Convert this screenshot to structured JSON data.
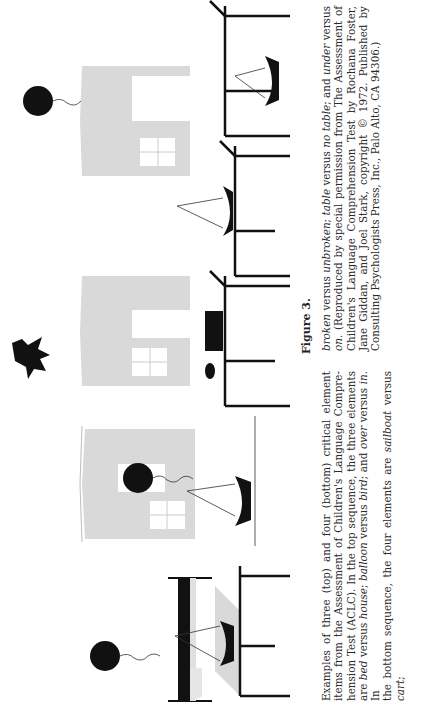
{
  "figure": {
    "label": "Figure 3.",
    "top_row_title": "Top sequence (three critical elements)",
    "bottom_row_title": "Bottom sequence (four critical elements)",
    "top_row_panels": [
      {
        "id": "balloon-and-bed",
        "elements": [
          "balloon",
          "bed"
        ]
      },
      {
        "id": "balloon-in-house",
        "elements": [
          "balloon",
          "house"
        ]
      },
      {
        "id": "bird-over-house",
        "elements": [
          "bird",
          "house"
        ]
      },
      {
        "id": "balloon-over-house",
        "elements": [
          "balloon",
          "house"
        ]
      }
    ],
    "bottom_row_panels": [
      {
        "id": "sailboat-on-table",
        "elements": [
          "sailboat",
          "table"
        ]
      },
      {
        "id": "sailboat-no-table",
        "elements": [
          "sailboat"
        ]
      },
      {
        "id": "broken-cart-under-table",
        "elements": [
          "cart",
          "table"
        ]
      },
      {
        "id": "sailboat-over-table",
        "elements": [
          "sailboat",
          "table"
        ]
      },
      {
        "id": "sailboat-under-table",
        "elements": [
          "sailboat",
          "table"
        ]
      }
    ]
  },
  "caption": {
    "left_column": [
      "Examples of three (top) and four (bottom) critical element",
      "items from the Assessment of Children's Language Compre-",
      "hension Test (ACLC). In the top sequence, the three elements",
      "are ",
      "the bottom sequence, the four elements are "
    ],
    "line4_parts": [
      "bed",
      " versus ",
      "house",
      "; ",
      "balloon",
      " versus ",
      "bird",
      "; and ",
      "over",
      " versus ",
      "in",
      ". In"
    ],
    "line5_parts": [
      "the bottom sequence, the four elements are ",
      "sailboat",
      " versus ",
      "cart",
      ";"
    ],
    "right_line1_parts": [
      "broken",
      " versus ",
      "unbroken",
      "; ",
      "table",
      " versus ",
      "no table",
      "; and ",
      "under",
      " versus"
    ],
    "right_line2_parts": [
      "on",
      ". (Reproduced by special permission from The Assessment of"
    ],
    "right_column_rest": [
      "Children's Language Comprehension Test by Rochana Foster,",
      "Jane Giddan, and Joel Stark, copyright © 1972. Published by",
      "Consulting Psychologists Press, Inc., Palo Alto, CA 94306.)"
    ]
  },
  "colors": {
    "ink": "#111111",
    "house_fill": "#d9d9d9",
    "text": "#2a2a2a"
  }
}
